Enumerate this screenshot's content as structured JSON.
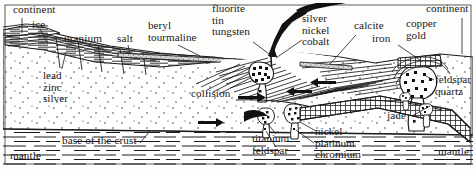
{
  "figure": {
    "frame_color": "#141414",
    "ink_color": "#1b1b1b",
    "paper_color": "#fdfdfb"
  },
  "labels": {
    "continent_left": "continent",
    "ice": "ice",
    "uranium": "uranium",
    "salt": "salt",
    "beryl": "beryl",
    "tourmaline": "tourmaline",
    "fluorite": "fluorite",
    "tin": "tin",
    "tungsten": "tungsten",
    "silver": "silver",
    "nickel_top": "nickel",
    "cobalt": "cobalt",
    "calcite": "calcite",
    "iron": "iron",
    "copper": "copper",
    "gold": "gold",
    "continent_right": "continent",
    "feldspar_right": "feldspar",
    "quartz": "quartz",
    "lead": "lead",
    "zinc": "zinc",
    "silver_left": "silver",
    "collision": "collision",
    "titanium": "titanium",
    "feldspar_bottom": "feldspar",
    "nickel_bottom": "nickel",
    "platinum": "platinum",
    "chromium": "chromium",
    "jade": "jade",
    "base_of_the_crust": "base of the crust",
    "mantle_left": "mantle",
    "mantle_right": "mantle"
  },
  "icons": {
    "arrow_collision": "right-arrow-icon",
    "volcano_plume": "volcano-plume-icon",
    "pluton": "pluton-balloon-icon",
    "slab": "subducting-slab-icon"
  }
}
